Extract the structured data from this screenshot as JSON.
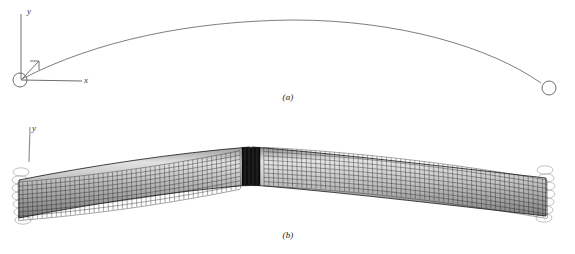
{
  "figure": {
    "background_color": "#ffffff",
    "width": 575,
    "height": 254,
    "caption_a": "(a)",
    "caption_b": "(b)"
  },
  "panel_a": {
    "name": "undeformed-centerline-geometry",
    "axes": {
      "y_label": "y",
      "x_label": "x",
      "z_label": "",
      "origin": {
        "x": 20,
        "y": 80
      },
      "y_tip": {
        "x": 21,
        "y": 14
      },
      "x_tip": {
        "x": 82,
        "y": 81
      },
      "z_tip": {
        "x": 38,
        "y": 61
      },
      "line_color": "#6e6e73",
      "origin_marker": "hinge-circle",
      "origin_marker_radius": 7
    },
    "arch_curve": {
      "name": "arch-centerline",
      "color": "#6e6e73",
      "stroke_width": 0.8,
      "left_end": {
        "x": 22,
        "y": 79
      },
      "apex": {
        "x": 293,
        "y": 20
      },
      "right_end": {
        "x": 545,
        "y": 86
      },
      "end_marker": "hinge-circle",
      "end_marker_radius": 7
    }
  },
  "panel_b": {
    "name": "deformed-shell-finite-element-mesh",
    "axes": {
      "y_label": "y",
      "origin": {
        "x": 28,
        "y": 161
      },
      "y_tip": {
        "x": 29,
        "y": 127
      },
      "line_color": "#8a8a8f"
    },
    "mesh": {
      "name": "quad-shell-mesh",
      "line_color": "#1c1c1c",
      "shade_light": "#d8d8d8",
      "shade_mid": "#a8a8a8",
      "shade_dark": "#6a6a6a",
      "left_end_x": 18,
      "right_end_x": 547,
      "apex_x": 258,
      "apex_top_y": 147,
      "left_top_y": 182,
      "right_top_y": 180,
      "depth": 38,
      "cols": 112,
      "rows": 9
    },
    "center_stiffener": {
      "name": "center-diaphragm",
      "color": "#0d0d0d",
      "x_start": 243,
      "x_end": 259
    },
    "supports": [
      {
        "name": "left-spring-support",
        "x": 20,
        "y": 196,
        "coils": 7
      },
      {
        "name": "right-spring-support",
        "x": 545,
        "y": 194,
        "coils": 7
      }
    ]
  }
}
